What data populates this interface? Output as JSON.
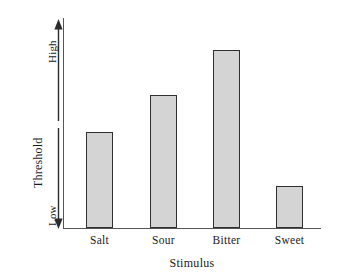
{
  "chart_data": {
    "type": "bar",
    "title": "",
    "xlabel": "Stimulus",
    "ylabel": "Threshold",
    "categories": [
      "Salt",
      "Sour",
      "Bitter",
      "Sweet"
    ],
    "values": [
      0.46,
      0.64,
      0.86,
      0.2
    ],
    "ylim": [
      0,
      1
    ],
    "y_tick_labels": [
      "Low",
      "High"
    ],
    "y_axis_direction": "double-headed arrow, Low at bottom, High at top",
    "grid": false,
    "legend": null,
    "bar_fill_color": "#d4d4d4",
    "bar_border_color": "#2f2f2f",
    "axis_color": "#555555",
    "background_color": "#ffffff"
  },
  "axes": {
    "y_title": "Threshold",
    "y_high_label": "High",
    "y_low_label": "Low",
    "x_title": "Stimulus"
  },
  "bars": [
    {
      "label": "Salt",
      "value": 0.46,
      "left": 86,
      "width": 27,
      "top": 132,
      "height": 96
    },
    {
      "label": "Sour",
      "value": 0.64,
      "left": 150,
      "width": 27,
      "top": 95,
      "height": 133
    },
    {
      "label": "Bitter",
      "value": 0.86,
      "left": 213,
      "width": 27,
      "top": 50,
      "height": 178
    },
    {
      "label": "Sweet",
      "value": 0.2,
      "left": 276,
      "width": 27,
      "top": 186,
      "height": 42
    }
  ],
  "icons": {
    "arrow_up": "arrow-up-icon",
    "arrow_down": "arrow-down-icon"
  }
}
